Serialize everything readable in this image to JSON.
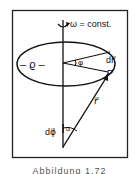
{
  "diagram": {
    "labels": {
      "omega": "ω = const.",
      "rho": "– ϱ –",
      "phi": "φ",
      "dr": "dr⃗",
      "point": "P",
      "r": "r⃗",
      "dphi": "dφ⃗",
      "alpha": "α"
    },
    "caption": "Abbildung 1.72"
  }
}
